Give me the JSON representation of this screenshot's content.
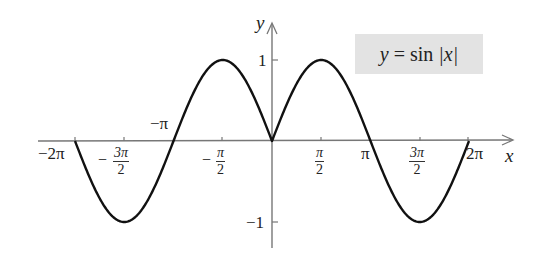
{
  "chart_data": {
    "type": "line",
    "title": "",
    "function": "y = sin|x|",
    "legend": [
      "y = sin |x|"
    ],
    "xlabel": "x",
    "ylabel": "y",
    "xlim": [
      -6.283,
      6.283
    ],
    "ylim": [
      -1,
      1
    ],
    "grid": false,
    "legend_position": "top-right",
    "x_tick_labels": [
      "-2π",
      "-3π/2",
      "-π",
      "-π/2",
      "π/2",
      "π",
      "3π/2",
      "2π"
    ],
    "y_tick_labels": [
      "1",
      "-1"
    ],
    "x": [
      -6.283,
      -4.712,
      -3.142,
      -1.571,
      0,
      1.571,
      3.142,
      4.712,
      6.283
    ],
    "series": [
      {
        "name": "y = sin|x|",
        "values": [
          0,
          -1,
          0,
          1,
          0,
          1,
          0,
          -1,
          0
        ]
      }
    ]
  },
  "labels": {
    "y_axis": "y",
    "x_axis": "x",
    "legend_lhs": "y",
    "legend_eq": " = sin ",
    "legend_abs": "|x|",
    "y_one": "1",
    "y_neg_one": "−1",
    "neg_two_pi": "−2π",
    "neg_pi": "−π",
    "pi": "π",
    "two_pi": "2π",
    "minus": "−",
    "three_pi": "3π",
    "pi_sym": "π",
    "two": "2"
  },
  "colors": {
    "curve": "#111111",
    "axis": "#777777",
    "legend_bg": "#e3e3e3"
  }
}
